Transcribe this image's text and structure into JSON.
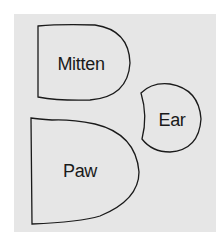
{
  "diagram": {
    "type": "sewing-pattern-pieces",
    "background": "#e6e6e6",
    "outline_color": "#1a1a1a",
    "pieces": [
      {
        "id": "mitten",
        "label": "Mitten"
      },
      {
        "id": "ear",
        "label": "Ear"
      },
      {
        "id": "paw",
        "label": "Paw"
      }
    ]
  }
}
